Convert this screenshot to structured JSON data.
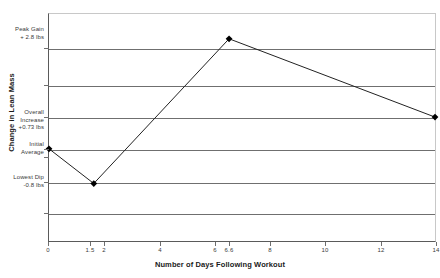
{
  "chart_data": {
    "type": "line",
    "title": "",
    "xlabel": "Number of Days Following Workout",
    "ylabel": "Change in Lean Mass",
    "xlim": [
      0,
      14
    ],
    "ylim": [
      -1.6,
      3.4
    ],
    "grid": true,
    "legend": false,
    "x_ticks": [
      "0",
      "1.5",
      "2",
      "4",
      "6",
      "6.6",
      "8",
      "10",
      "12",
      "14"
    ],
    "x_tick_values": [
      0,
      1.5,
      2,
      4,
      6,
      6.6,
      8,
      10,
      12,
      14
    ],
    "y_tick_values": [
      -1.6,
      -0.8,
      0,
      0.73,
      1.4,
      2.1,
      2.8,
      3.4
    ],
    "series": [
      {
        "name": "Change in Lean Mass",
        "x": [
          0,
          1.5,
          6.6,
          14
        ],
        "values": [
          0,
          -0.8,
          2.8,
          0.73
        ],
        "marker": "diamond",
        "color": "#000000"
      }
    ],
    "annotations": [
      {
        "id": "peak-gain",
        "lines": [
          "Peak Gain",
          "+ 2.8 lbs"
        ],
        "y_value": 2.8
      },
      {
        "id": "overall-increase",
        "lines": [
          "Overall",
          "Increase",
          "+0.73 lbs"
        ],
        "y_value": 0.73
      },
      {
        "id": "initial-average",
        "lines": [
          "Initial",
          "Average"
        ],
        "y_value": 0
      },
      {
        "id": "lowest-dip",
        "lines": [
          "Lowest Dip",
          "-0.8 lbs"
        ],
        "y_value": -0.8
      }
    ]
  },
  "axes": {
    "x_title": "Number of Days Following Workout",
    "y_title": "Change in Lean Mass"
  },
  "ticks": {
    "x": [
      {
        "label": "0",
        "px": 48
      },
      {
        "label": "1.5",
        "px": 90
      },
      {
        "label": "2",
        "px": 104
      },
      {
        "label": "4",
        "px": 160
      },
      {
        "label": "6",
        "px": 215
      },
      {
        "label": "6.6",
        "px": 229
      },
      {
        "label": "8",
        "px": 270
      },
      {
        "label": "10",
        "px": 325
      },
      {
        "label": "12",
        "px": 381
      },
      {
        "label": "14",
        "px": 436
      }
    ]
  },
  "annotation_text": {
    "peak_gain_l1": "Peak Gain",
    "peak_gain_l2": "+ 2.8 lbs",
    "overall_l1": "Overall",
    "overall_l2": "Increase",
    "overall_l3": "+0.73 lbs",
    "initial_l1": "Initial",
    "initial_l2": "Average",
    "dip_l1": "Lowest Dip",
    "dip_l2": "-0.8 lbs"
  }
}
